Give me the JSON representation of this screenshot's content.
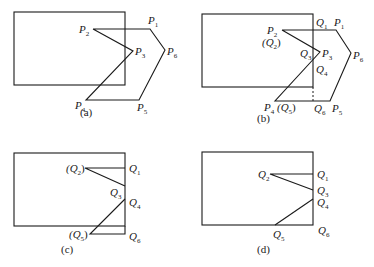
{
  "figure": {
    "panels": [
      {
        "id": "a",
        "caption": "(a)",
        "caption_pos": [
          80,
          116
        ],
        "clip_rect": {
          "x": 14,
          "y": 12,
          "w": 111,
          "h": 73
        },
        "polylines": [
          {
            "style": "edge",
            "points": [
              [
                93,
                29
              ],
              [
                150,
                29
              ],
              [
                165,
                50
              ],
              [
                139,
                100
              ],
              [
                86,
                100
              ],
              [
                133,
                51
              ],
              [
                93,
                29
              ]
            ]
          }
        ],
        "labels": [
          {
            "text": "P",
            "sub": "1",
            "pos": [
              148,
              24
            ]
          },
          {
            "text": "P",
            "sub": "2",
            "pos": [
              79,
              33
            ]
          },
          {
            "text": "P",
            "sub": "3",
            "pos": [
              135,
              55
            ]
          },
          {
            "text": "P",
            "sub": "6",
            "pos": [
              167,
              55
            ]
          },
          {
            "text": "P",
            "sub": "4",
            "pos": [
              75,
              109
            ]
          },
          {
            "text": "P",
            "sub": "5",
            "pos": [
              137,
              111
            ]
          }
        ]
      },
      {
        "id": "b",
        "caption": "(b)",
        "caption_pos": [
          257,
          122
        ],
        "clip_rect": {
          "x": 202,
          "y": 14,
          "w": 111,
          "h": 73
        },
        "polylines": [
          {
            "style": "edge",
            "points": [
              [
                282,
                30
              ],
              [
                336,
                30
              ],
              [
                351,
                53
              ],
              [
                330,
                101
              ],
              [
                275,
                101
              ],
              [
                320,
                52
              ],
              [
                282,
                30
              ]
            ]
          },
          {
            "style": "dash",
            "points": [
              [
                313,
                87
              ],
              [
                313,
                101
              ]
            ]
          }
        ],
        "labels": [
          {
            "text": "Q",
            "sub": "1",
            "pos": [
              316,
              26
            ]
          },
          {
            "text": "P",
            "sub": "1",
            "pos": [
              334,
              26
            ]
          },
          {
            "text": "P",
            "sub": "2",
            "pos": [
              267,
              34
            ]
          },
          {
            "text": "(Q",
            "sub": "2",
            "tail": ")",
            "pos": [
              262,
              46
            ]
          },
          {
            "text": "Q",
            "sub": "3",
            "pos": [
              300,
              57
            ]
          },
          {
            "text": "P",
            "sub": "3",
            "pos": [
              322,
              57
            ]
          },
          {
            "text": "P",
            "sub": "6",
            "pos": [
              353,
              59
            ]
          },
          {
            "text": "Q",
            "sub": "4",
            "pos": [
              316,
              73
            ]
          },
          {
            "text": "P",
            "sub": "4",
            "pos": [
              264,
              111
            ]
          },
          {
            "text": "(Q",
            "sub": "5",
            "tail": ")",
            "pos": [
              277,
              111
            ]
          },
          {
            "text": "Q",
            "sub": "6",
            "pos": [
              314,
              112
            ]
          },
          {
            "text": "P",
            "sub": "5",
            "pos": [
              332,
              112
            ]
          }
        ]
      },
      {
        "id": "c",
        "caption": "(c)",
        "caption_pos": [
          61,
          253
        ],
        "clip_rect": {
          "x": 14,
          "y": 153,
          "w": 111,
          "h": 73
        },
        "polylines": [
          {
            "style": "edge",
            "points": [
              [
                125,
                168
              ],
              [
                85,
                168
              ],
              [
                125,
                186
              ]
            ]
          },
          {
            "style": "edge",
            "points": [
              [
                125,
                199
              ],
              [
                90,
                234
              ],
              [
                125,
                234
              ],
              [
                125,
                226
              ]
            ]
          }
        ],
        "labels": [
          {
            "text": "(Q",
            "sub": "2",
            "tail": ")",
            "pos": [
              66,
              172
            ]
          },
          {
            "text": "Q",
            "sub": "1",
            "pos": [
              129,
              172
            ]
          },
          {
            "text": "Q",
            "sub": "3",
            "pos": [
              110,
              196
            ]
          },
          {
            "text": "Q",
            "sub": "4",
            "pos": [
              129,
              206
            ]
          },
          {
            "text": "(Q",
            "sub": "5",
            "tail": ")",
            "pos": [
              69,
              238
            ]
          },
          {
            "text": "Q",
            "sub": "6",
            "pos": [
              129,
              240
            ]
          }
        ]
      },
      {
        "id": "d",
        "caption": "(d)",
        "caption_pos": [
          257,
          253
        ],
        "clip_rect": {
          "x": 202,
          "y": 152,
          "w": 111,
          "h": 73
        },
        "polylines": [
          {
            "style": "edge",
            "points": [
              [
                313,
                174
              ],
              [
                270,
                174
              ],
              [
                313,
                190
              ]
            ]
          },
          {
            "style": "edge",
            "points": [
              [
                313,
                199
              ],
              [
                275,
                225
              ]
            ]
          }
        ],
        "labels": [
          {
            "text": "Q",
            "sub": "2",
            "pos": [
              258,
              178
            ]
          },
          {
            "text": "Q",
            "sub": "1",
            "pos": [
              317,
              178
            ]
          },
          {
            "text": "Q",
            "sub": "3",
            "pos": [
              317,
              194
            ]
          },
          {
            "text": "Q",
            "sub": "4",
            "pos": [
              317,
              206
            ]
          },
          {
            "text": "Q",
            "sub": "5",
            "pos": [
              273,
              238
            ]
          },
          {
            "text": "Q",
            "sub": "6",
            "pos": [
              318,
              234
            ]
          }
        ]
      }
    ]
  }
}
